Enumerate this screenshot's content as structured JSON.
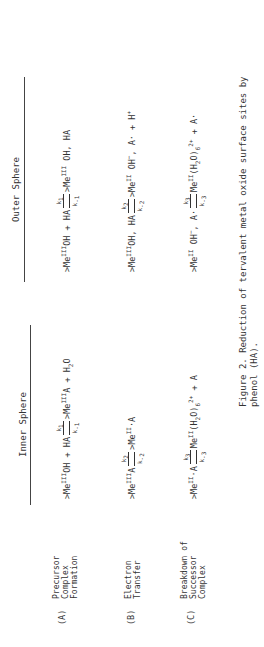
{
  "headers": {
    "inner": "Inner Sphere",
    "outer": "Outer Sphere"
  },
  "rows": [
    {
      "id": "(A)",
      "label": [
        "Precursor",
        "Complex",
        "Formation"
      ],
      "inner": {
        "left": ">Me^III OH + HA",
        "kf": "k1",
        "kr": "k-1",
        "right": ">Me^III A + H2O"
      },
      "outer": {
        "left": ">Me^III OH + HA",
        "kf": "k1",
        "kr": "k-1",
        "right": ">Me^III OH, HA"
      }
    },
    {
      "id": "(B)",
      "label": [
        "Electron",
        "Transfer"
      ],
      "inner": {
        "left": ">Me^III A",
        "kf": "k2",
        "kr": "k-2",
        "right": ">Me^II ·A"
      },
      "outer": {
        "left": ">Me^III OH, HA",
        "kf": "k2",
        "kr": "k-2",
        "right": ">Me^II OH−, A· + H+"
      }
    },
    {
      "id": "(C)",
      "label": [
        "Breakdown of",
        "Successor",
        "Complex"
      ],
      "inner": {
        "left": ">Me^II ·A",
        "kf": "k3",
        "kr": "k-3",
        "right": "Me^II (H2O)6 2+ + A"
      },
      "outer": {
        "left": ">Me^II OH−, A·",
        "kf": "k3",
        "kr": "k-3",
        "right": "Me^II (H2O)6 2+ + A·"
      }
    }
  ],
  "caption": {
    "line1": "Figure 2.  Reduction of tervalent metal oxide surface sites by",
    "line2": "phenol (HA)."
  }
}
